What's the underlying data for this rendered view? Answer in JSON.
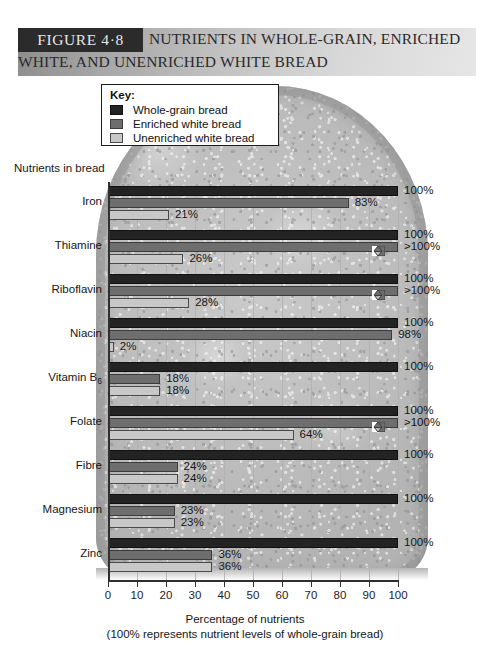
{
  "figure": {
    "tag": "FIGURE 4·8",
    "title_line1": "NUTRIENTS IN WHOLE-GRAIN, ENRICHED",
    "title_line2": "WHITE, AND UNENRICHED WHITE BREAD"
  },
  "key": {
    "title": "Key:",
    "items": [
      {
        "label": "Whole-grain bread",
        "color": "#232323"
      },
      {
        "label": "Enriched white bread",
        "color": "#6e6e6e"
      },
      {
        "label": "Unenriched white bread",
        "color": "#c8c8c8"
      }
    ]
  },
  "chart_data": {
    "type": "bar",
    "orientation": "horizontal",
    "title": "NUTRIENTS IN WHOLE-GRAIN, ENRICHED WHITE, AND UNENRICHED WHITE BREAD",
    "xlabel": "Percentage of nutrients",
    "xlabel_note": "(100% represents nutrient levels of whole-grain bread)",
    "ylabel": "Nutrients in bread",
    "xlim": [
      0,
      100
    ],
    "xticks": [
      0,
      10,
      20,
      30,
      40,
      50,
      60,
      70,
      80,
      90,
      100
    ],
    "grid": true,
    "legend_position": "top-left",
    "categories": [
      "Iron",
      "Thiamine",
      "Riboflavin",
      "Niacin",
      "Vitamin B6",
      "Folate",
      "Fibre",
      "Magnesium",
      "Zinc"
    ],
    "series": [
      {
        "name": "Whole-grain bread",
        "color": "#232323",
        "values": [
          100,
          100,
          100,
          100,
          100,
          100,
          100,
          100,
          100
        ],
        "labels": [
          "100%",
          "100%",
          "100%",
          "100%",
          "100%",
          "100%",
          "100%",
          "100%",
          "100%"
        ],
        "over_limit": [
          false,
          false,
          false,
          false,
          false,
          false,
          false,
          false,
          false
        ]
      },
      {
        "name": "Enriched white bread",
        "color": "#6e6e6e",
        "values": [
          83,
          105,
          105,
          98,
          18,
          105,
          24,
          23,
          36
        ],
        "labels": [
          "83%",
          ">100%",
          ">100%",
          "98%",
          "18%",
          ">100%",
          "24%",
          "23%",
          "36%"
        ],
        "over_limit": [
          false,
          true,
          true,
          false,
          false,
          true,
          false,
          false,
          false
        ]
      },
      {
        "name": "Unenriched white bread",
        "color": "#c8c8c8",
        "values": [
          21,
          26,
          28,
          2,
          18,
          64,
          24,
          23,
          36
        ],
        "labels": [
          "21%",
          "26%",
          "28%",
          "2%",
          "18%",
          "64%",
          "24%",
          "23%",
          "36%"
        ],
        "over_limit": [
          false,
          false,
          false,
          false,
          false,
          false,
          false,
          false,
          false
        ]
      }
    ]
  },
  "axis": {
    "tick_labels": [
      "0",
      "10",
      "20",
      "30",
      "40",
      "50",
      "60",
      "70",
      "80",
      "90",
      "100"
    ]
  }
}
